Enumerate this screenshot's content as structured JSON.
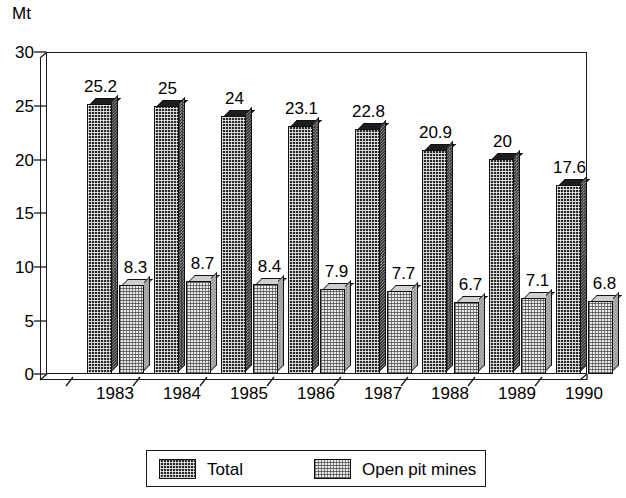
{
  "chart_data": {
    "type": "bar",
    "title": "",
    "subtitle": "",
    "xlabel": "",
    "ylabel": "Mt",
    "unit_label": "Mt",
    "categories": [
      "1983",
      "1984",
      "1985",
      "1986",
      "1987",
      "1988",
      "1989",
      "1990"
    ],
    "series": [
      {
        "name": "Total",
        "values": [
          25.2,
          25,
          24,
          23.1,
          22.8,
          20.9,
          20,
          17.6
        ],
        "value_labels": [
          "25.2",
          "25",
          "24",
          "23.1",
          "22.8",
          "20.9",
          "20",
          "17.6"
        ],
        "fill": "dark-crosshatch",
        "color": "#2a2a2a"
      },
      {
        "name": "Open pit mines",
        "values": [
          8.3,
          8.7,
          8.4,
          7.9,
          7.7,
          6.7,
          7.1,
          6.8
        ],
        "value_labels": [
          "8.3",
          "8.7",
          "8.4",
          "7.9",
          "7.7",
          "6.7",
          "7.1",
          "6.8"
        ],
        "fill": "light-dotted",
        "color": "#e9e9e9"
      }
    ],
    "ylim": [
      0,
      30
    ],
    "yticks": [
      0,
      5,
      10,
      15,
      20,
      25,
      30
    ],
    "ytick_labels": [
      "0",
      "5",
      "10",
      "15",
      "20",
      "25",
      "30"
    ],
    "grid": false,
    "legend_position": "bottom",
    "style": "3d-bar-monochrome"
  },
  "legend": {
    "entries": [
      {
        "label": "Total",
        "swatch": "dark-crosshatch-swatch"
      },
      {
        "label": "Open pit mines",
        "swatch": "light-dotted-swatch"
      }
    ]
  }
}
